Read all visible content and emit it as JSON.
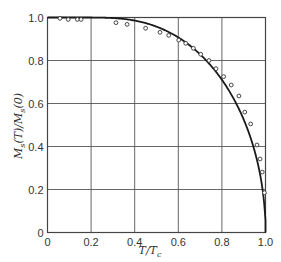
{
  "chart_data": {
    "type": "line",
    "title": "",
    "xlabel": "T/T_c",
    "ylabel": "M_s(T)/M_s(0)",
    "xlim": [
      0,
      1.0
    ],
    "ylim": [
      0,
      1.0
    ],
    "grid": true,
    "legend": null,
    "x_ticks": [
      "0",
      "0.2",
      "0.4",
      "0.6",
      "0.8",
      "1.0"
    ],
    "y_ticks": [
      "0",
      "0.2",
      "0.4",
      "0.6",
      "0.8",
      "1.0"
    ],
    "series": [
      {
        "name": "theory curve (mean-field, S=1/2)",
        "style": "solid line",
        "color": "#1a1a1a",
        "x": [
          0.0,
          0.1,
          0.2,
          0.3,
          0.4,
          0.5,
          0.6,
          0.7,
          0.75,
          0.8,
          0.85,
          0.9,
          0.95,
          0.98,
          1.0
        ],
        "y": [
          1.0,
          1.0,
          1.0,
          0.997,
          0.987,
          0.957,
          0.907,
          0.829,
          0.776,
          0.71,
          0.626,
          0.525,
          0.379,
          0.245,
          0.0
        ]
      },
      {
        "name": "experimental data",
        "style": "open circles",
        "color": "#333333",
        "x": [
          0.057,
          0.095,
          0.137,
          0.154,
          0.314,
          0.365,
          0.45,
          0.516,
          0.556,
          0.602,
          0.634,
          0.669,
          0.703,
          0.741,
          0.773,
          0.808,
          0.843,
          0.878,
          0.905,
          0.932,
          0.961,
          0.975,
          0.985,
          0.995
        ],
        "y": [
          0.996,
          0.991,
          0.991,
          0.991,
          0.976,
          0.968,
          0.95,
          0.931,
          0.917,
          0.895,
          0.88,
          0.857,
          0.829,
          0.8,
          0.762,
          0.725,
          0.686,
          0.635,
          0.56,
          0.505,
          0.407,
          0.342,
          0.281,
          0.185
        ]
      }
    ]
  },
  "labels": {
    "x_axis_main": "T/T",
    "x_axis_sub": "c",
    "y_axis_M": "M",
    "y_axis_sub": "s",
    "y_axis_rest": "(T)/M",
    "y_axis_sub2": "s",
    "y_axis_end": "(0)"
  }
}
